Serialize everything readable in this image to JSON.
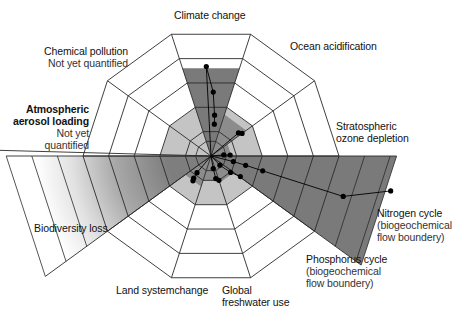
{
  "diagram": {
    "center": [
      211,
      156
    ],
    "ring_count": 5,
    "outer_radius": 128,
    "sectors": [
      {
        "id": "climate-change",
        "label": "Climate change",
        "sub": "",
        "angle_start": -108,
        "angle_end": -72,
        "value": 0.72,
        "fill": "#7a7a7a"
      },
      {
        "id": "ocean-acidification",
        "label": "Ocean acidification",
        "sub": "",
        "angle_start": -72,
        "angle_end": -36,
        "value": 0.34,
        "fill": "#8c8c8c"
      },
      {
        "id": "stratospheric-ozone",
        "label": "Stratospheric ozone depletion",
        "sub": "",
        "angle_start": -36,
        "angle_end": 0,
        "value": 0.16,
        "fill": "#8c8c8c"
      },
      {
        "id": "nitrogen-cycle",
        "label": "Nitrogen cycle",
        "sub": "(biogeochemical flow boundery)",
        "angle_start": 0,
        "angle_end": 36,
        "value": 1.45,
        "fill": "#7a7a7a"
      },
      {
        "id": "phosphorus-cycle",
        "label": "Phosphorus cycle",
        "sub": "(biogeochemical flow boundery)",
        "angle_start": 36,
        "angle_end": 72,
        "value": 0.22,
        "fill": "#8c8c8c"
      },
      {
        "id": "global-freshwater",
        "label": "Global freshwater use",
        "sub": "",
        "angle_start": 72,
        "angle_end": 108,
        "value": 0.2,
        "fill": "#8c8c8c"
      },
      {
        "id": "land-system-change",
        "label": "Land systemchange",
        "sub": "",
        "angle_start": 108,
        "angle_end": 144,
        "value": 0.25,
        "fill": "#8c8c8c"
      },
      {
        "id": "biodiversity-loss",
        "label": "Biodiversity loss",
        "sub": "",
        "angle_start": 144,
        "angle_end": 180,
        "value": 1.6,
        "fill": "gradient"
      },
      {
        "id": "aerosol-loading",
        "label": "Atmospheric aerosol loading",
        "sub": "Not yet quantified",
        "angle_start": 180,
        "angle_end": 216,
        "value": 0,
        "fill": "none"
      },
      {
        "id": "chemical-pollution",
        "label": "Chemical pollution",
        "sub": "Not yet quantified",
        "angle_start": 216,
        "angle_end": 252,
        "value": 0,
        "fill": "none"
      }
    ],
    "safe_zone": {
      "radius": 0.4,
      "fill": "#c4c4c4"
    },
    "labels": {
      "climate": "Climate change",
      "ocean": "Ocean acidification",
      "ozone_1": "Stratospheric",
      "ozone_2": "ozone depletion",
      "nitrogen_1": "Nitrogen cycle",
      "nitrogen_2": "(biogeochemical",
      "nitrogen_3": "flow boundery)",
      "phosphorus_1": "Phosphorus cycle",
      "phosphorus_2": "(biogeochemical",
      "phosphorus_3": "flow boundery)",
      "freshwater_1": "Global",
      "freshwater_2": "freshwater use",
      "land": "Land systemchange",
      "biodiversity": "Biodiversity loss",
      "aerosol_1": "Atmospheric",
      "aerosol_2": "aerosol loading",
      "aerosol_3": "Not yet",
      "aerosol_4": "quantified",
      "chemical_1": "Chemical pollution",
      "chemical_2": "Not yet quantified"
    },
    "colors": {
      "grid": "#2a2a2a",
      "safe_zone": "#c4c4c4",
      "exceeded": "#7a7a7a",
      "marker": "#000000",
      "background": "#ffffff"
    }
  }
}
